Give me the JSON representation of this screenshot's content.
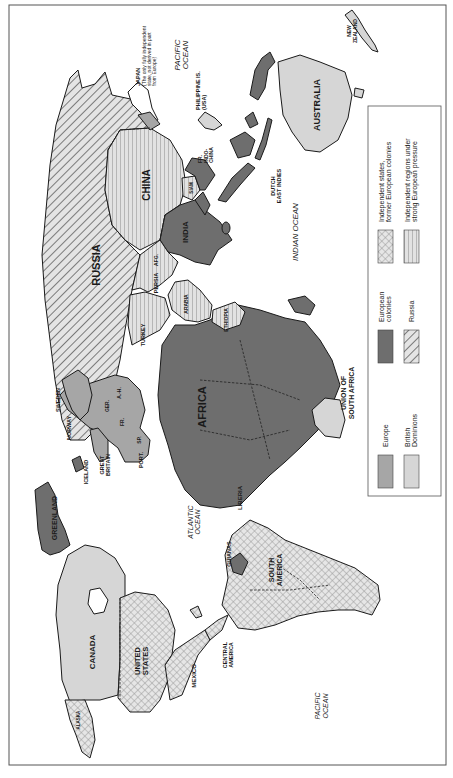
{
  "map": {
    "orientation": "rotated 90 degrees counter-clockwise (north at left)",
    "colors": {
      "europe": "#a6a6a6",
      "british_dominions": "#d6d6d6",
      "european_colonies": "#6e6e6e",
      "russia_hatch": "#8a8a8a",
      "independent_states_crosshatch": "#9a9a9a",
      "pressure_stripes": "#a0a0a0",
      "background": "#ffffff",
      "outline": "#1a1a1a"
    },
    "labels": {
      "russia": "RUSSIA",
      "china": "CHINA",
      "india": "INDIA",
      "japan": "JAPAN",
      "japan_note_1": "(The only fully independent",
      "japan_note_2": "state, not derived in part",
      "japan_note_3": "from Europe)",
      "philippines_1": "PHILIPPINE IS.",
      "philippines_2": "(USA)",
      "fr_indochina_1": "FR.",
      "fr_indochina_2": "INDO-",
      "fr_indochina_3": "CHINA",
      "siam": "SIAM",
      "dutch_east_indies_1": "DUTCH",
      "dutch_east_indies_2": "EAST INDIES",
      "australia": "AUSTRALIA",
      "new_zealand_1": "NEW",
      "new_zealand_2": "ZEALAND",
      "pacific_ocean_top_1": "PACIFIC",
      "pacific_ocean_top_2": "OCEAN",
      "indian_ocean": "INDIAN  OCEAN",
      "persia": "PERSIA",
      "afg": "AFG.",
      "arabia": "ARABIA",
      "turkey": "TURKEY",
      "ethiopia": "ETHIOPIA",
      "africa": "AFRICA",
      "union_sa_1": "UNION OF",
      "union_sa_2": "SOUTH AFRICA",
      "liberia": "LIBERIA",
      "sweden": "SWEDEN",
      "norway": "NORWAY",
      "ger": "GER.",
      "ah": "A.-H.",
      "fr": "FR.",
      "sp": "SP.",
      "port": "PORT.",
      "great_britain_1": "GREAT",
      "great_britain_2": "BRITAIN",
      "iceland": "ICELAND",
      "greenland": "GREENLAND",
      "atlantic_ocean_1": "ATLANTIC",
      "atlantic_ocean_2": "OCEAN",
      "canada": "CANADA",
      "united_states_1": "UNITED",
      "united_states_2": "STATES",
      "mexico": "MEXICO",
      "central_america_1": "CENTRAL",
      "central_america_2": "AMERICA",
      "guianas": "GUIANAS",
      "south_america_1": "SOUTH",
      "south_america_2": "AMERICA",
      "alaska": "ALASKA",
      "pacific_ocean_bottom_1": "PACIFIC",
      "pacific_ocean_bottom_2": "OCEAN"
    }
  },
  "legend": {
    "items": [
      {
        "key": "europe",
        "label_1": "Europe",
        "label_2": ""
      },
      {
        "key": "british_dominions",
        "label_1": "British",
        "label_2": "Dominions"
      },
      {
        "key": "european_colonies",
        "label_1": "European",
        "label_2": "colonies"
      },
      {
        "key": "russia",
        "label_1": "Russia",
        "label_2": ""
      },
      {
        "key": "independent_states",
        "label_1": "Independent states,",
        "label_2": "former European colonies"
      },
      {
        "key": "independent_regions",
        "label_1": "Independent regions under",
        "label_2": "strong European pressure"
      }
    ]
  }
}
